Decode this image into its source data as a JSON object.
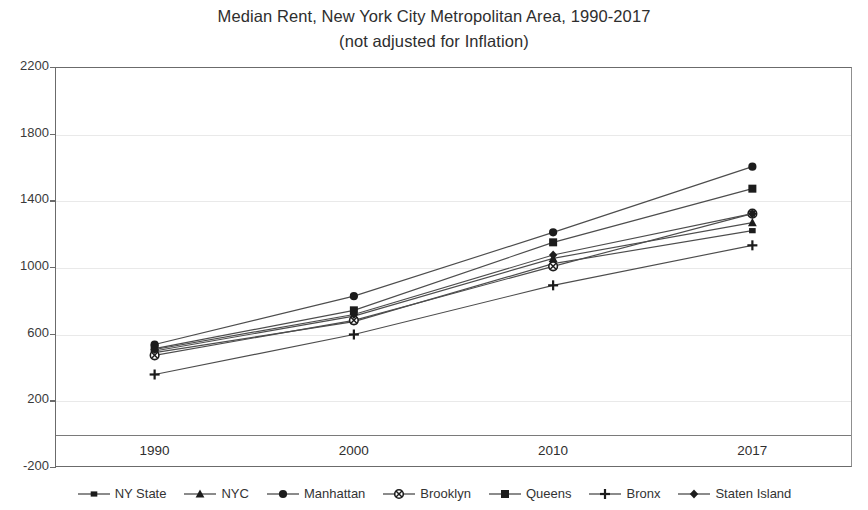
{
  "chart_data": {
    "type": "line",
    "title": "Median Rent, New York City Metropolitan Area, 1990-2017",
    "subtitle": "(not adjusted for Inflation)",
    "xlabel": "",
    "ylabel": "",
    "categories": [
      "1990",
      "2000",
      "2010",
      "2017"
    ],
    "x": [
      1990,
      2000,
      2010,
      2017
    ],
    "yticks": [
      2200,
      1800,
      1400,
      1000,
      600,
      200,
      -200
    ],
    "ylim": [
      -200,
      2200
    ],
    "grid": true,
    "legend_position": "bottom",
    "series": [
      {
        "name": "NY State",
        "marker": "square-small",
        "values": [
          486,
          672,
          1020,
          1218
        ]
      },
      {
        "name": "NYC",
        "marker": "triangle",
        "values": [
          496,
          705,
          1052,
          1266
        ]
      },
      {
        "name": "Manhattan",
        "marker": "circle",
        "values": [
          535,
          825,
          1208,
          1602
        ]
      },
      {
        "name": "Brooklyn",
        "marker": "circle-x",
        "values": [
          470,
          680,
          1004,
          1320
        ]
      },
      {
        "name": "Queens",
        "marker": "square",
        "values": [
          510,
          740,
          1148,
          1470
        ]
      },
      {
        "name": "Bronx",
        "marker": "plus",
        "values": [
          355,
          595,
          890,
          1130
        ]
      },
      {
        "name": "Staten Island",
        "marker": "diamond",
        "values": [
          505,
          715,
          1072,
          1320
        ]
      }
    ]
  },
  "axis": {
    "y_tick_labels": [
      "2200",
      "1800",
      "1400",
      "1000",
      "600",
      "200",
      "-200"
    ],
    "x_tick_labels": [
      "1990",
      "2000",
      "2010",
      "2017"
    ]
  },
  "legend": {
    "items": [
      {
        "label": "NY State",
        "icon": "square-small-marker-icon"
      },
      {
        "label": "NYC",
        "icon": "triangle-marker-icon"
      },
      {
        "label": "Manhattan",
        "icon": "circle-marker-icon"
      },
      {
        "label": "Brooklyn",
        "icon": "circle-x-marker-icon"
      },
      {
        "label": "Queens",
        "icon": "square-marker-icon"
      },
      {
        "label": "Bronx",
        "icon": "plus-marker-icon"
      },
      {
        "label": "Staten Island",
        "icon": "diamond-marker-icon"
      }
    ]
  },
  "colors": {
    "series_line": "#4d4d4d",
    "marker": "#1c1c1c",
    "grid": "#e9e9e9",
    "axis": "#6b6b6b",
    "text": "#333333",
    "background": "#ffffff"
  }
}
